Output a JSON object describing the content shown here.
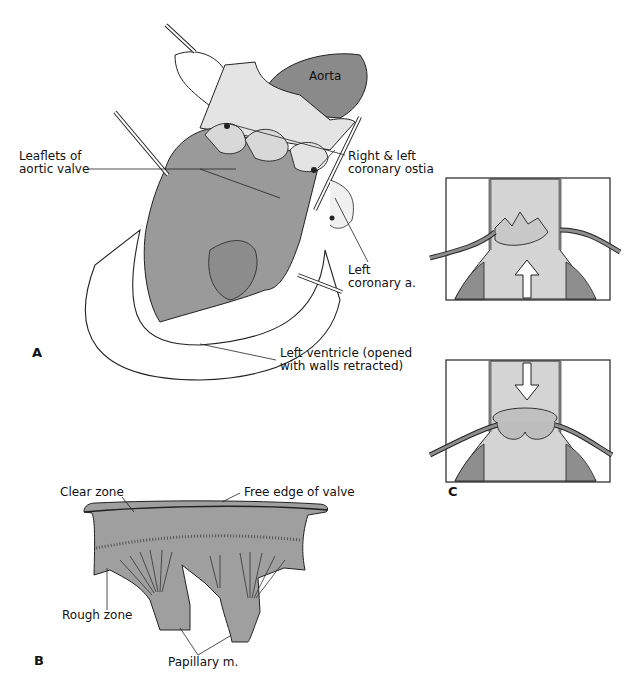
{
  "colors": {
    "tissue_gray": "#9a9a9a",
    "dark_gray": "#7a7a7a",
    "light_gray": "#d4d4d4",
    "line": "#222222",
    "background": "#ffffff"
  },
  "panels": {
    "A": {
      "letter": "A",
      "labels": {
        "aorta": "Aorta",
        "leaflets_line1": "Leaflets of",
        "leaflets_line2": "aortic valve",
        "ostia_line1": "Right & left",
        "ostia_line2": "coronary ostia",
        "left_coronary_line1": "Left",
        "left_coronary_line2": "coronary a.",
        "ventricle_line1": "Left ventricle (opened",
        "ventricle_line2": "with walls retracted)"
      }
    },
    "B": {
      "letter": "B",
      "labels": {
        "clear_zone": "Clear zone",
        "free_edge": "Free edge of valve",
        "rough_zone": "Rough zone",
        "papillary": "Papillary m."
      }
    },
    "C": {
      "letter": "C",
      "frames": [
        {
          "name": "valve-open",
          "arrow": "up"
        },
        {
          "name": "valve-closed",
          "arrow": "down"
        }
      ]
    }
  }
}
